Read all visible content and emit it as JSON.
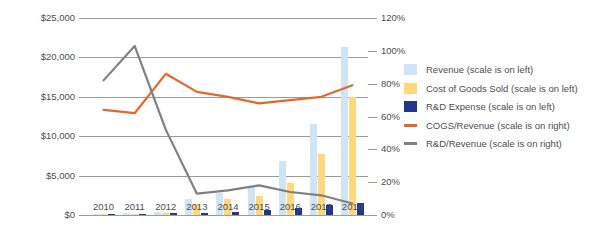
{
  "chart_data": {
    "type": "bar",
    "title": "",
    "xlabel": "",
    "ylabel": "",
    "categories": [
      "2010",
      "2011",
      "2012",
      "2013",
      "2014",
      "2015",
      "2016",
      "2017",
      "2018"
    ],
    "grid": true,
    "legend_position": "right",
    "left_axis": {
      "label": "",
      "ticks": [
        "$0",
        "$5,000",
        "$10,000",
        "$15,000",
        "$20,000",
        "$25,000"
      ],
      "tick_values": [
        0,
        5000,
        10000,
        15000,
        20000,
        25000
      ],
      "ylim": [
        0,
        25000
      ]
    },
    "right_axis": {
      "label": "",
      "ticks": [
        "0%",
        "20%",
        "40%",
        "60%",
        "80%",
        "100%",
        "120%"
      ],
      "tick_values": [
        0,
        20,
        40,
        60,
        80,
        100,
        120
      ],
      "ylim": [
        0,
        120
      ]
    },
    "series": [
      {
        "name": "Revenue (scale is on left)",
        "short_name": "Revenue",
        "kind": "bar",
        "axis": "left",
        "color": "#cfe5f3",
        "values": [
          120,
          200,
          400,
          2000,
          2800,
          3500,
          6800,
          11500,
          21300
        ]
      },
      {
        "name": "Cost of Goods Sold (scale is on left)",
        "short_name": "Cost of Goods Sold",
        "kind": "bar",
        "axis": "left",
        "color": "#fcd97f",
        "values": [
          80,
          130,
          290,
          1450,
          2050,
          2450,
          4100,
          7700,
          15000
        ]
      },
      {
        "name": "R&D Expense (scale is on left)",
        "short_name": "R&D Expense",
        "kind": "bar",
        "axis": "left",
        "color": "#22378c",
        "values": [
          95,
          140,
          200,
          270,
          360,
          620,
          880,
          1250,
          1500
        ]
      },
      {
        "name": "COGS/Revenue (scale is on right)",
        "short_name": "COGS/Revenue",
        "kind": "line",
        "axis": "right",
        "color": "#e8662a",
        "values": [
          64,
          62,
          86,
          75,
          72,
          68,
          70,
          72,
          79
        ]
      },
      {
        "name": "R&D/Revenue (scale is on right)",
        "short_name": "R&D/Revenue",
        "kind": "line",
        "axis": "right",
        "color": "#808080",
        "values": [
          82,
          103,
          52,
          13,
          15,
          18,
          14,
          12,
          7
        ]
      }
    ]
  },
  "legend": {
    "items": [
      {
        "label": "Revenue (scale is on left)",
        "color": "#cfe5f3",
        "type": "box"
      },
      {
        "label": "Cost of Goods Sold (scale is on left)",
        "color": "#fcd97f",
        "type": "box"
      },
      {
        "label": "R&D Expense (scale is on left)",
        "color": "#22378c",
        "type": "box"
      },
      {
        "label": "COGS/Revenue (scale is on right)",
        "color": "#e8662a",
        "type": "line"
      },
      {
        "label": "R&D/Revenue (scale is on right)",
        "color": "#808080",
        "type": "line"
      }
    ]
  }
}
